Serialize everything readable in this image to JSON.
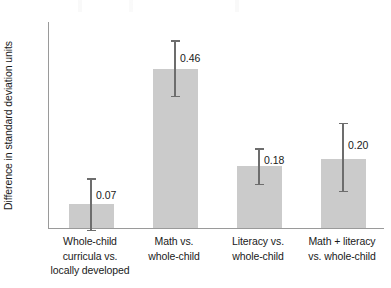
{
  "chart_data": {
    "type": "bar",
    "title": "",
    "subtitle": "",
    "xlabel": "",
    "ylabel": "Difference in standard deviation units",
    "ylim": [
      0,
      0.6
    ],
    "ytick_values": [
      0,
      0.15,
      0.3,
      0.45,
      0.6
    ],
    "ytick_labels": [
      "0",
      ".15",
      ".3",
      ".45",
      ".6"
    ],
    "grid": false,
    "legend": null,
    "categories": [
      "Whole-child curricula vs. locally developed",
      "Math vs. whole-child",
      "Literacy vs. whole-child",
      "Math + literacy vs. whole-child"
    ],
    "category_label_lines": [
      [
        "Whole-child",
        "curricula vs.",
        "locally developed"
      ],
      [
        "Math vs.",
        "whole-child"
      ],
      [
        "Literacy vs.",
        "whole-child"
      ],
      [
        "Math + literacy",
        "vs. whole-child"
      ]
    ],
    "values": [
      0.07,
      0.46,
      0.18,
      0.2
    ],
    "value_labels": [
      "0.07",
      "0.46",
      "0.18",
      "0.20"
    ],
    "error_bars": [
      {
        "low": -0.005,
        "high": 0.145
      },
      {
        "low": 0.385,
        "high": 0.545
      },
      {
        "low": 0.128,
        "high": 0.232
      },
      {
        "low": 0.108,
        "high": 0.305
      }
    ],
    "bar_color": "#cbcbcb",
    "errorbar_color": "#6d6d6d",
    "axis_color": "#9a9a9a",
    "text_color": "#1a1a1a"
  }
}
